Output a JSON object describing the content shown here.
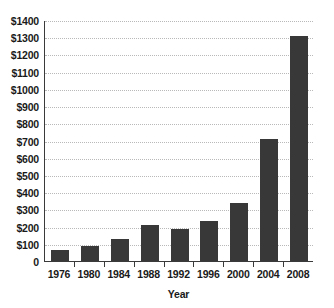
{
  "chart_data": {
    "type": "bar",
    "title": "",
    "xlabel": "Year",
    "ylabel": "",
    "categories": [
      "1976",
      "1980",
      "1984",
      "1988",
      "1992",
      "1996",
      "2000",
      "2004",
      "2008"
    ],
    "values": [
      65,
      88,
      128,
      210,
      188,
      230,
      335,
      710,
      1310
    ],
    "ylim": [
      0,
      1400
    ],
    "y_ticks": [
      0,
      100,
      200,
      300,
      400,
      500,
      600,
      700,
      800,
      900,
      1000,
      1100,
      1200,
      1300,
      1400
    ],
    "y_tick_labels": [
      "0",
      "$100",
      "$200",
      "$300",
      "$400",
      "$500",
      "$600",
      "$700",
      "$800",
      "$900",
      "$1000",
      "$1100",
      "$1200",
      "$1300",
      "$1400"
    ],
    "grid": true,
    "grid_axis": "y",
    "legend": false,
    "legend_position": "none",
    "bar_color": "#383838",
    "grid_color": "#b9b9b9",
    "axis_color": "#3a3a3a",
    "background_color": "#ffffff"
  }
}
